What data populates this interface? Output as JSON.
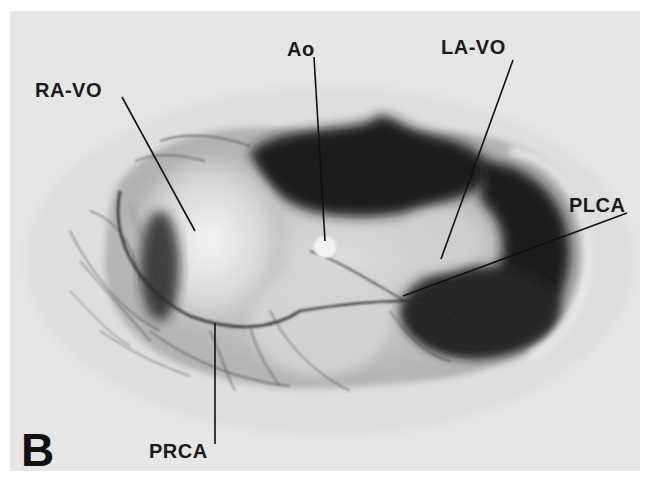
{
  "figure": {
    "panel_label": "B",
    "background_color": "#e6e6e6",
    "labels": [
      {
        "id": "ra-vo",
        "text": "RA-VO"
      },
      {
        "id": "ao",
        "text": "Ao"
      },
      {
        "id": "la-vo",
        "text": "LA-VO"
      },
      {
        "id": "plca",
        "text": "PLCA"
      },
      {
        "id": "prca",
        "text": "PRCA"
      }
    ]
  }
}
